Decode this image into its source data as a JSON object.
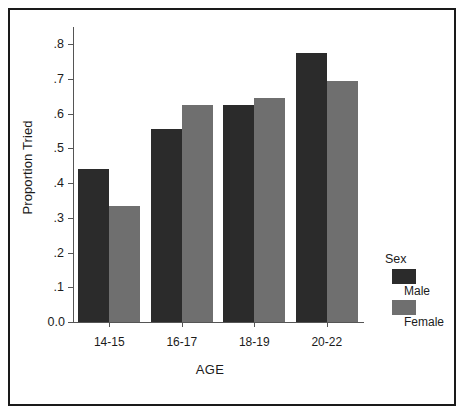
{
  "chart_data": {
    "type": "bar",
    "title": "",
    "subtitle": "",
    "xlabel": "AGE",
    "ylabel": "Proportion Tried",
    "categories": [
      "14-15",
      "16-17",
      "18-19",
      "20-22"
    ],
    "series": [
      {
        "name": "Male",
        "color": "#2b2b2b",
        "values": [
          0.44,
          0.555,
          0.625,
          0.775
        ]
      },
      {
        "name": "Female",
        "color": "#6f6f6f",
        "values": [
          0.335,
          0.625,
          0.645,
          0.695
        ]
      }
    ],
    "ylim": [
      0.0,
      0.85
    ],
    "ytick_values": [
      0.0,
      0.1,
      0.2,
      0.3,
      0.4,
      0.5,
      0.6,
      0.7,
      0.8
    ],
    "ytick_labels": [
      "0.0",
      ".1",
      ".2",
      ".3",
      ".4",
      ".5",
      ".6",
      ".7",
      ".8"
    ],
    "grid": false,
    "legend_position": "right-bottom",
    "legend_title": "Sex"
  },
  "legend": {
    "title": "Sex",
    "entries": [
      {
        "label": "Male",
        "color": "#2b2b2b"
      },
      {
        "label": "Female",
        "color": "#6f6f6f"
      }
    ]
  },
  "axes": {
    "x_title": "AGE",
    "y_title": "Proportion Tried"
  }
}
